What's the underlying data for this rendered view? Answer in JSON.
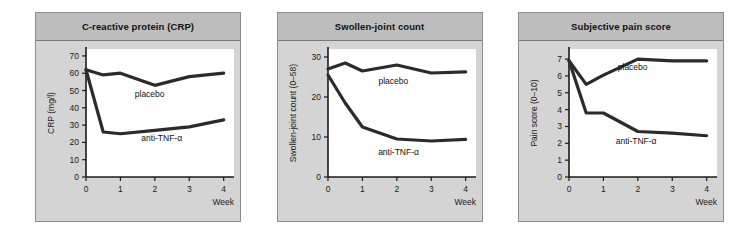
{
  "figure": {
    "background": "#ffffff",
    "panel_fill": "#d4d4d4",
    "panel_header_fill": "#bdbdbd",
    "curve_color": "#2b2b2b",
    "axis_color": "#1a1a1a"
  },
  "panels": [
    {
      "title": "C-reactive protein (CRP)",
      "xlabel": "Week",
      "ylabel": "CRP (mg/l)"
    },
    {
      "title": "Swollen-joint count",
      "xlabel": "Week",
      "ylabel": "Swollen-joint count (0–58)"
    },
    {
      "title": "Subjective pain score",
      "xlabel": "Week",
      "ylabel": "Pain score (0–10)"
    }
  ],
  "chart_data": [
    {
      "type": "line",
      "title": "C-reactive protein (CRP)",
      "xlabel": "Week",
      "ylabel": "CRP (mg/l)",
      "x": [
        0,
        0.5,
        1,
        2,
        3,
        4
      ],
      "xlim": [
        0,
        4.3
      ],
      "ylim": [
        0,
        74
      ],
      "xticks": [
        0,
        1,
        2,
        3,
        4
      ],
      "xticklabels": [
        "0",
        "1",
        "2",
        "3",
        "4"
      ],
      "yticks": [
        0,
        10,
        20,
        30,
        40,
        50,
        60,
        70
      ],
      "yticklabels": [
        "0",
        "10",
        "20",
        "30",
        "40",
        "50",
        "60",
        "70"
      ],
      "grid": false,
      "legend_position": "inline-annotation",
      "series": [
        {
          "name": "placebo",
          "values": [
            62,
            59,
            60,
            53,
            58,
            60
          ]
        },
        {
          "name": "anti-TNF-α",
          "values": [
            62,
            26,
            25,
            27,
            29,
            33
          ]
        }
      ],
      "annotations": [
        {
          "text": "placebo",
          "x": 1.85,
          "y": 46
        },
        {
          "text": "anti-TNF-α",
          "x": 2.2,
          "y": 21
        }
      ]
    },
    {
      "type": "line",
      "title": "Swollen-joint count",
      "xlabel": "Week",
      "ylabel": "Swollen-joint count (0–58)",
      "x": [
        0,
        0.5,
        1,
        2,
        3,
        4
      ],
      "xlim": [
        0,
        4.3
      ],
      "ylim": [
        0,
        32
      ],
      "xticks": [
        0,
        1,
        2,
        3,
        4
      ],
      "xticklabels": [
        "0",
        "1",
        "2",
        "3",
        "4"
      ],
      "yticks": [
        0,
        10,
        20,
        30
      ],
      "yticklabels": [
        "0",
        "10",
        "20",
        "30"
      ],
      "grid": false,
      "legend_position": "inline-annotation",
      "series": [
        {
          "name": "placebo",
          "values": [
            27,
            28.5,
            26.5,
            28,
            26,
            26.3
          ]
        },
        {
          "name": "anti-TNF-α",
          "values": [
            25.5,
            18.5,
            12.5,
            9.5,
            9,
            9.4
          ]
        }
      ],
      "annotations": [
        {
          "text": "placebo",
          "x": 1.9,
          "y": 23.2
        },
        {
          "text": "anti-TNF-α",
          "x": 2.05,
          "y": 5.6
        }
      ]
    },
    {
      "type": "line",
      "title": "Subjective pain score",
      "xlabel": "Week",
      "ylabel": "Pain score (0–10)",
      "x": [
        0,
        0.5,
        1,
        2,
        3,
        4
      ],
      "xlim": [
        0,
        4.3
      ],
      "ylim": [
        0,
        7.6
      ],
      "xticks": [
        0,
        1,
        2,
        3,
        4
      ],
      "xticklabels": [
        "0",
        "1",
        "2",
        "3",
        "4"
      ],
      "yticks": [
        0,
        1,
        2,
        3,
        4,
        5,
        6,
        7
      ],
      "yticklabels": [
        "0",
        "1",
        "2",
        "3",
        "4",
        "5",
        "6",
        "7"
      ],
      "grid": false,
      "legend_position": "inline-annotation",
      "series": [
        {
          "name": "placebo",
          "values": [
            6.9,
            5.5,
            6.05,
            7.0,
            6.9,
            6.9
          ]
        },
        {
          "name": "anti-TNF-α",
          "values": [
            6.9,
            3.8,
            3.8,
            2.7,
            2.6,
            2.45
          ]
        }
      ],
      "annotations": [
        {
          "text": "placebo",
          "x": 1.85,
          "y": 6.35
        },
        {
          "text": "anti-TNF-α",
          "x": 1.95,
          "y": 1.95
        }
      ]
    }
  ]
}
